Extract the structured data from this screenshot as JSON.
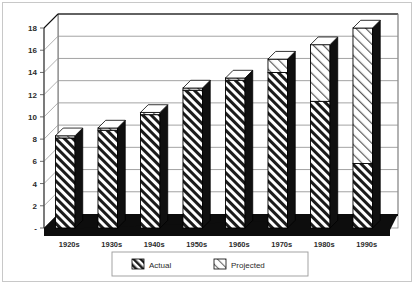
{
  "chart_data": {
    "type": "bar",
    "title": "",
    "subtitle": "",
    "xlabel": "",
    "ylabel": "",
    "stacked": true,
    "three_d": true,
    "grid": true,
    "legend_position": "bottom",
    "ylim": [
      0,
      18
    ],
    "yticks": [
      0,
      2,
      4,
      6,
      8,
      10,
      12,
      14,
      16,
      18
    ],
    "ytick_labels": [
      "-",
      "2",
      "4",
      "6",
      "8",
      "10",
      "12",
      "14",
      "16",
      "18"
    ],
    "categories": [
      "1920s",
      "1930s",
      "1940s",
      "1950s",
      "1960s",
      "1970s",
      "1980s",
      "1990s"
    ],
    "series": [
      {
        "name": "Actual",
        "pattern": "dense-diagonal-hatch",
        "values": [
          8.1,
          8.8,
          10.2,
          12.4,
          13.3,
          14.0,
          11.4,
          5.8
        ]
      },
      {
        "name": "Projected",
        "pattern": "light-diagonal-hatch",
        "values": [
          0.2,
          0.2,
          0.2,
          0.2,
          0.2,
          1.2,
          5.1,
          12.2
        ]
      }
    ],
    "totals": [
      8.3,
      9.0,
      10.4,
      12.6,
      13.5,
      15.2,
      16.5,
      18.0
    ]
  },
  "legend": {
    "items": [
      {
        "label": "Actual"
      },
      {
        "label": "Projected"
      }
    ]
  },
  "colors": {
    "axis": "#4a4a4a",
    "grid": "#8c8c8c",
    "bar_outline": "#000000",
    "bar_side": "#101010",
    "floor": "#0d0d0d",
    "text": "#2b2b2b",
    "background": "#ffffff"
  }
}
